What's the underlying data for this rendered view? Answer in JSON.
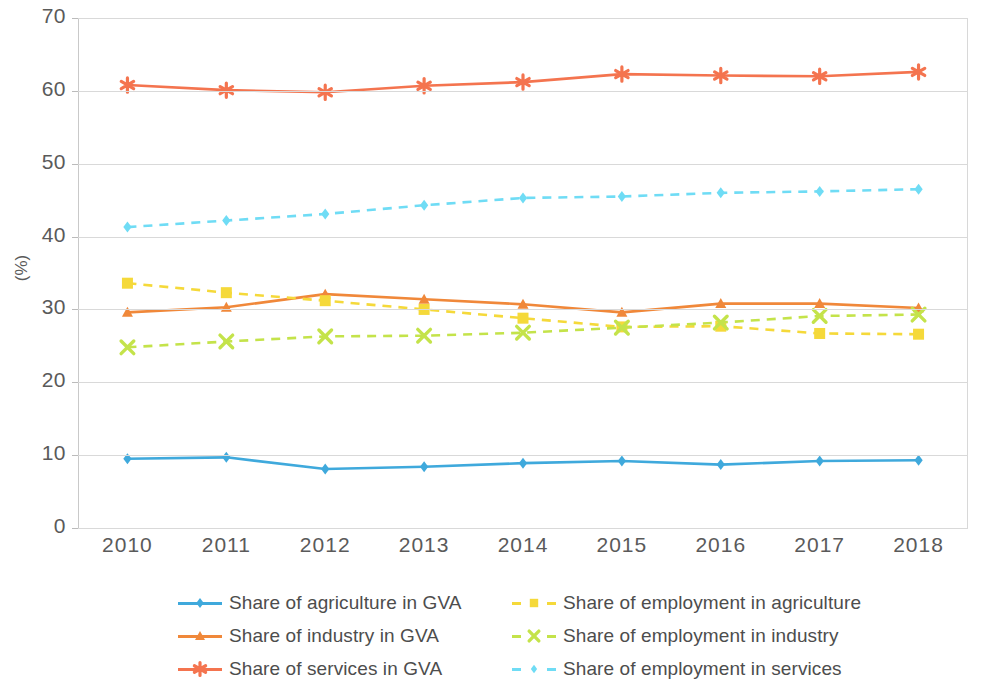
{
  "chart_data": {
    "type": "line",
    "title": "",
    "xlabel": "",
    "ylabel": "(%)",
    "categories": [
      "2010",
      "2011",
      "2012",
      "2013",
      "2014",
      "2015",
      "2016",
      "2017",
      "2018"
    ],
    "ylim": [
      0,
      70
    ],
    "yticks": [
      0,
      10,
      20,
      30,
      40,
      50,
      60,
      70
    ],
    "grid": true,
    "legend_position": "bottom",
    "series": [
      {
        "name": "Share of agriculture in GVA",
        "color": "#3fa9dc",
        "marker": "diamond",
        "style": "solid",
        "values": [
          9.5,
          9.7,
          8.1,
          8.4,
          8.9,
          9.2,
          8.7,
          9.2,
          9.3
        ]
      },
      {
        "name": "Share of industry in GVA",
        "color": "#f0883a",
        "marker": "triangle",
        "style": "solid",
        "values": [
          29.6,
          30.3,
          32.1,
          31.4,
          30.7,
          29.6,
          30.8,
          30.8,
          30.2
        ]
      },
      {
        "name": "Share of services in GVA",
        "color": "#f4744f",
        "marker": "asterisk",
        "style": "solid",
        "values": [
          60.8,
          60.1,
          59.8,
          60.7,
          61.2,
          62.3,
          62.1,
          62.0,
          62.6
        ]
      },
      {
        "name": "Share of employment in agriculture",
        "color": "#f5d93a",
        "marker": "square",
        "style": "dashed",
        "values": [
          33.6,
          32.3,
          31.2,
          30.0,
          28.8,
          27.6,
          27.7,
          26.7,
          26.6
        ]
      },
      {
        "name": "Share of employment in industry",
        "color": "#c4e34a",
        "marker": "cross",
        "style": "dashed",
        "values": [
          24.8,
          25.6,
          26.3,
          26.4,
          26.8,
          27.5,
          28.2,
          29.1,
          29.3
        ]
      },
      {
        "name": "Share of employment in services",
        "color": "#6fdcf5",
        "marker": "diamond",
        "style": "dashed",
        "values": [
          41.3,
          42.2,
          43.1,
          44.3,
          45.3,
          45.5,
          46.0,
          46.2,
          46.5
        ]
      }
    ]
  },
  "axis": {
    "y_title": "(%)",
    "y_labels": [
      "70",
      "60",
      "50",
      "40",
      "30",
      "20",
      "10",
      "0"
    ],
    "x_labels": [
      "2010",
      "2011",
      "2012",
      "2013",
      "2014",
      "2015",
      "2016",
      "2017",
      "2018"
    ]
  },
  "legend": {
    "left_column": [
      "Share of agriculture in GVA",
      "Share of industry in GVA",
      "Share of services in GVA"
    ],
    "right_column": [
      "Share of employment in agriculture",
      "Share of employment in industry",
      "Share of employment in services"
    ]
  }
}
